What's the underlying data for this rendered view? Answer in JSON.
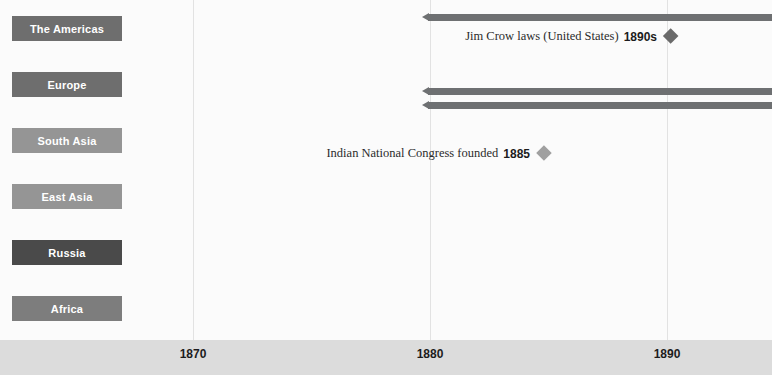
{
  "chart_data": {
    "type": "timeline",
    "title": "",
    "xlabel": "",
    "ylabel": "",
    "xlim": [
      1862,
      1894
    ],
    "grid": true,
    "legend_position": "none",
    "axis": {
      "ticks": [
        {
          "label": "1870",
          "value": 1870,
          "x": 193
        },
        {
          "label": "1880",
          "value": 1880,
          "x": 430
        },
        {
          "label": "1890",
          "value": 1890,
          "x": 667
        }
      ]
    },
    "categories": [
      {
        "label": "The Americas",
        "color": "#6e6e6e",
        "y": 16
      },
      {
        "label": "Europe",
        "color": "#6e6e6e",
        "y": 72
      },
      {
        "label": "South Asia",
        "color": "#959595",
        "y": 128
      },
      {
        "label": "East Asia",
        "color": "#959595",
        "y": 184
      },
      {
        "label": "Russia",
        "color": "#4a4a4a",
        "y": 240
      },
      {
        "label": "Africa",
        "color": "#7d7d7d",
        "y": 296
      }
    ],
    "bars": [
      {
        "category": "The Americas",
        "start_x": 428,
        "end_x": 772,
        "y": 14,
        "color": "#6e7072"
      },
      {
        "category": "Europe",
        "start_x": 428,
        "end_x": 772,
        "y": 88,
        "color": "#6e7072"
      },
      {
        "category": "Europe",
        "start_x": 428,
        "end_x": 772,
        "y": 102,
        "color": "#6e7072"
      }
    ],
    "annotations": [
      {
        "text": "Jim Crow laws (United States)",
        "date": "1890s",
        "category": "The Americas",
        "marker_x": 670,
        "y": 36,
        "color": "#6a6a6a"
      },
      {
        "text": "Indian National Congress founded",
        "date": "1885",
        "category": "South Asia",
        "marker_x": 543,
        "y": 153,
        "color": "#a0a0a0"
      }
    ],
    "colors": {
      "background": "#fbfbfb",
      "axis_band": "#dcdcdc",
      "gridline": "#e2e2e2",
      "bar": "#6e7072",
      "tick_text": "#1c1c1c"
    }
  }
}
